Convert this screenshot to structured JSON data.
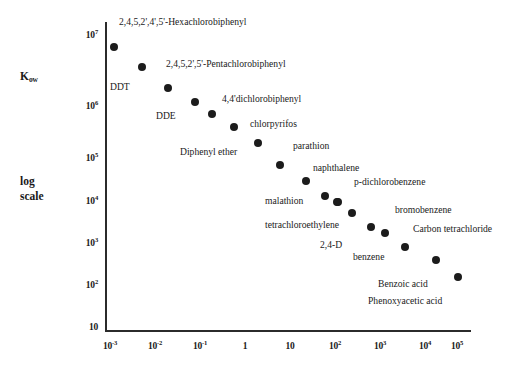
{
  "chart_data": {
    "type": "scatter",
    "title": "",
    "xlabel": "",
    "ylabel": "Kow",
    "ylabel_lines": [
      "Kow",
      "log",
      "scale"
    ],
    "axis_caption_kow": "K",
    "axis_caption_kow_sub": "ow",
    "axis_caption_log": "log",
    "axis_caption_scale": "scale",
    "grid": false,
    "legend": "none",
    "xscale": "log",
    "yscale": "log",
    "xlim": [
      0.001,
      100000
    ],
    "ylim": [
      10,
      10000000
    ],
    "xticks": [
      "10-3",
      "10-2",
      "10-1",
      "1",
      "10",
      "102",
      "103",
      "104",
      "105"
    ],
    "xtick_labels": [
      {
        "mantissa": "10",
        "exp": "-3"
      },
      {
        "mantissa": "10",
        "exp": "-2"
      },
      {
        "mantissa": "10",
        "exp": "-1"
      },
      {
        "mantissa": "1",
        "exp": ""
      },
      {
        "mantissa": "10",
        "exp": ""
      },
      {
        "mantissa": "10",
        "exp": "2"
      },
      {
        "mantissa": "10",
        "exp": "3"
      },
      {
        "mantissa": "10",
        "exp": "4"
      },
      {
        "mantissa": "10",
        "exp": "5"
      }
    ],
    "ytick_labels": [
      {
        "mantissa": "10",
        "exp": "7"
      },
      {
        "mantissa": "10",
        "exp": "6"
      },
      {
        "mantissa": "10",
        "exp": "5"
      },
      {
        "mantissa": "10",
        "exp": "4"
      },
      {
        "mantissa": "10",
        "exp": "3"
      },
      {
        "mantissa": "10",
        "exp": "2"
      },
      {
        "mantissa": "10",
        "exp": ""
      }
    ],
    "points": [
      {
        "label": "2,4,5,2',4',5'-Hexachlorobiphenyl",
        "x": 0.0013,
        "y": 5500000,
        "px": 114,
        "py": 47
      },
      {
        "label": "",
        "x": 0.0048,
        "y": 1800000,
        "px": 142,
        "py": 67
      },
      {
        "label": "DDT",
        "x": 0.019,
        "y": 580000,
        "px": 168,
        "py": 88
      },
      {
        "label": "2,4,5,2',5'-Pentachlorobiphenyl",
        "x": 0.068,
        "y": 250000,
        "px": 195,
        "py": 102
      },
      {
        "label": "DDE",
        "x": 0.16,
        "y": 125000,
        "px": 212,
        "py": 114
      },
      {
        "label": "4,4'dichlorobiphenyl",
        "x": 0.5,
        "y": 62000,
        "px": 234,
        "py": 127
      },
      {
        "label": "chlorpyrifos",
        "x": 1.6,
        "y": 29000,
        "px": 258,
        "py": 143
      },
      {
        "label": "Diphenyl ether",
        "x": 5.5,
        "y": 9500,
        "px": 280,
        "py": 165
      },
      {
        "label": "parathion",
        "x": 23,
        "y": 3800,
        "px": 306,
        "py": 181
      },
      {
        "label": "naphthalene",
        "x": 75,
        "y": 1600,
        "px": 325,
        "py": 196
      },
      {
        "label": "malathion",
        "x": 145,
        "y": 1200,
        "px": 337,
        "py": 202
      },
      {
        "label": "p-dichlorobenzene",
        "x": 150,
        "y": 1150,
        "px": 338,
        "py": 202
      },
      {
        "label": "tetrachloroethylene",
        "x": 260,
        "y": 720,
        "px": 352,
        "py": 213
      },
      {
        "label": "bromobenzene",
        "x": 700,
        "y": 430,
        "px": 371,
        "py": 227
      },
      {
        "label": "2,4-D",
        "x": 780,
        "y": 250,
        "px": 385,
        "py": 233
      },
      {
        "label": "benzene",
        "x": 2100,
        "y": 145,
        "px": 405,
        "py": 247
      },
      {
        "label": "Carbon tetrachloride",
        "x": 9500,
        "y": 60,
        "px": 436,
        "py": 260
      },
      {
        "label": "Benzoic acid",
        "x": 55000,
        "y": 22,
        "px": 458,
        "py": 277
      }
    ],
    "annotations": [
      {
        "text": "2,4,5,2',4',5'-Hexachlorobiphenyl",
        "px": 119,
        "py": 17
      },
      {
        "text": "2,4,5,2',5'-Pentachlorobiphenyl",
        "px": 166,
        "py": 59
      },
      {
        "text": "DDT",
        "px": 110,
        "py": 82
      },
      {
        "text": "4,4'dichlorobiphenyl",
        "px": 222,
        "py": 94
      },
      {
        "text": "DDE",
        "px": 156,
        "py": 111
      },
      {
        "text": "chlorpyrifos",
        "px": 250,
        "py": 119
      },
      {
        "text": "Diphenyl ether",
        "px": 180,
        "py": 147
      },
      {
        "text": "parathion",
        "px": 293,
        "py": 141
      },
      {
        "text": "naphthalene",
        "px": 313,
        "py": 163
      },
      {
        "text": "p-dichlorobenzene",
        "px": 354,
        "py": 177
      },
      {
        "text": "malathion",
        "px": 265,
        "py": 196
      },
      {
        "text": "bromobenzene",
        "px": 395,
        "py": 205
      },
      {
        "text": "tetrachloroethylene",
        "px": 265,
        "py": 220
      },
      {
        "text": "Carbon tetrachloride",
        "px": 413,
        "py": 224
      },
      {
        "text": "2,4-D",
        "px": 320,
        "py": 240
      },
      {
        "text": "benzene",
        "px": 353,
        "py": 252
      },
      {
        "text": "Benzoic acid",
        "px": 378,
        "py": 279
      },
      {
        "text": "Phenoxyacetic acid",
        "px": 368,
        "py": 296
      }
    ],
    "ytick_px": [
      35,
      77,
      119,
      161,
      203,
      245,
      287
    ],
    "ytick_px_actual": [
      35,
      106,
      158,
      201,
      243,
      285,
      327
    ],
    "xtick_px": [
      110,
      155,
      200,
      245,
      290,
      335,
      380,
      425,
      457
    ]
  }
}
